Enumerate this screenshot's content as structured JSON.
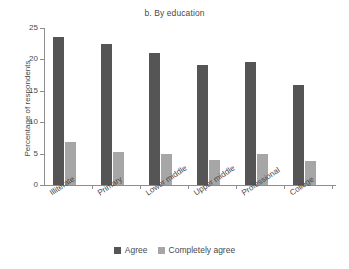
{
  "chart_data": {
    "type": "bar",
    "title": "b. By education",
    "xlabel": "",
    "ylabel": "Percentage of respondents",
    "categories": [
      "Illiterate",
      "Primary",
      "Lower middle",
      "Upper middle",
      "Professional",
      "College"
    ],
    "series": [
      {
        "name": "Agree",
        "color": "#555555",
        "values": [
          23.5,
          22.5,
          21.1,
          19.1,
          19.6,
          15.9
        ]
      },
      {
        "name": "Completely agree",
        "color": "#a6a6a6",
        "values": [
          6.9,
          5.3,
          4.9,
          4.0,
          5.0,
          3.9
        ]
      }
    ],
    "ylim": [
      0,
      25
    ],
    "yticks": [
      0,
      5,
      10,
      15,
      20,
      25
    ],
    "ytick_labels": [
      "0",
      "5",
      "10",
      "15",
      "20",
      "25"
    ],
    "grid": false,
    "legend_position": "bottom"
  }
}
